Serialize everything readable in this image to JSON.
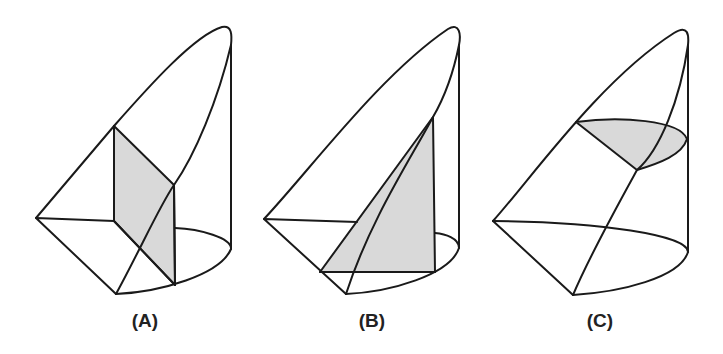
{
  "figures": [
    {
      "id": "A",
      "label": "(A)",
      "description": "Solid with a shaded vertical rectangular cross-section perpendicular to the base diameter"
    },
    {
      "id": "B",
      "label": "(B)",
      "description": "Solid with a shaded triangular cross-section"
    },
    {
      "id": "C",
      "label": "(C)",
      "description": "Solid with a shaded horizontal semicircular-like cross-section"
    }
  ],
  "colors": {
    "stroke": "#1a1a1a",
    "shade": "#d9d9d9",
    "background": "#ffffff"
  }
}
